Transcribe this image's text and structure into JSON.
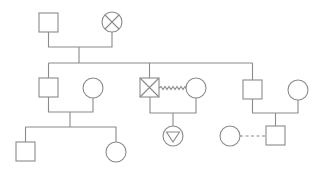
{
  "diagram": {
    "type": "genogram",
    "stroke_color": "#8a8a8a",
    "background": "#ffffff",
    "nodes": [
      {
        "id": "g1_male",
        "shape": "square",
        "marker": "none",
        "label": "Grandfather",
        "x": 39,
        "y": 13,
        "size": 19
      },
      {
        "id": "g1_female",
        "shape": "circle",
        "marker": "cross-x",
        "label": "Grandmother (deceased)",
        "cx": 112,
        "cy": 22,
        "r": 10
      },
      {
        "id": "c1_male",
        "shape": "square",
        "marker": "none",
        "label": "Son 1",
        "x": 39,
        "y": 78,
        "size": 19
      },
      {
        "id": "c1_spouse",
        "shape": "circle",
        "marker": "none",
        "label": "Son 1 spouse",
        "cx": 93,
        "cy": 88,
        "r": 10
      },
      {
        "id": "c2_male",
        "shape": "square",
        "marker": "cross-x",
        "label": "Son 2 (deceased)",
        "x": 140,
        "y": 78,
        "size": 19
      },
      {
        "id": "c2_partner",
        "shape": "circle",
        "marker": "none",
        "label": "Son 2 partner",
        "cx": 196,
        "cy": 88,
        "r": 10
      },
      {
        "id": "c3_male",
        "shape": "square",
        "marker": "none",
        "label": "Son 3",
        "x": 243,
        "y": 80,
        "size": 19
      },
      {
        "id": "c3_spouse",
        "shape": "circle",
        "marker": "none",
        "label": "Son 3 spouse",
        "cx": 298,
        "cy": 90,
        "r": 10
      },
      {
        "id": "gc1_male",
        "shape": "square",
        "marker": "none",
        "label": "Grandson 1",
        "x": 16,
        "y": 142,
        "size": 19
      },
      {
        "id": "gc1_female",
        "shape": "circle",
        "marker": "none",
        "label": "Granddaughter 1",
        "cx": 116,
        "cy": 152,
        "r": 10
      },
      {
        "id": "gc2_unknown",
        "shape": "circle",
        "marker": "triangle-down",
        "label": "Grandchild (unknown gender)",
        "cx": 173,
        "cy": 136,
        "r": 10
      },
      {
        "id": "gc3_male",
        "shape": "square",
        "marker": "none",
        "label": "Grandson 3",
        "x": 266,
        "y": 126,
        "size": 19
      },
      {
        "id": "gc3_partner",
        "shape": "circle",
        "marker": "none",
        "label": "Grandson 3 partner",
        "cx": 230,
        "cy": 136,
        "r": 10
      }
    ],
    "relationships": [
      {
        "from": "g1_male",
        "to": "g1_female",
        "type": "marriage"
      },
      {
        "from": "c1_male",
        "to": "c1_spouse",
        "type": "marriage"
      },
      {
        "from": "c2_male",
        "to": "c2_partner",
        "type": "conflict-zigzag"
      },
      {
        "from": "c3_male",
        "to": "c3_spouse",
        "type": "marriage"
      },
      {
        "from": "gc3_partner",
        "to": "gc3_male",
        "type": "dashed-relationship"
      }
    ]
  }
}
